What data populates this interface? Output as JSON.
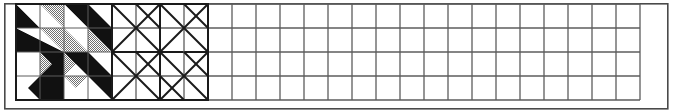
{
  "document": {
    "title": "Quilt Block Design Grid",
    "type": "pinwheel quilt block worksheet"
  },
  "canvas": {
    "width": 673,
    "height": 112,
    "background": "#ffffff"
  },
  "frame": {
    "name": "outer-frame",
    "x": 4,
    "y": 3,
    "width": 664,
    "height": 106,
    "stroke": "#4a4a4a",
    "stroke_width": 1.6,
    "fill": "#ffffff"
  },
  "grid": {
    "name": "design-grid",
    "origin_x": 16,
    "origin_y": 4,
    "cell_size": 24,
    "columns": 26,
    "rows": 4,
    "line_color": "#5c5c5c",
    "line_width": 1.3,
    "block_line_color": "#1a1a1a",
    "block_line_width": 2.0,
    "total_width": 624,
    "total_height": 96
  },
  "palette": {
    "black": "#111111",
    "gray": "#9a9a9a",
    "white": "#ffffff",
    "grid_line": "#5c5c5c",
    "frame_line": "#4a4a4a",
    "ink": "#1a1a1a"
  },
  "blocks": [
    {
      "name": "pinwheel-block-filled",
      "index": 1,
      "col_start": 0,
      "row_start": 0,
      "size_cells": 4,
      "style": "filled",
      "description": "Four-quadrant pinwheel of half-square triangles in black, gray and white"
    },
    {
      "name": "pinwheel-block-outline",
      "index": 2,
      "col_start": 4,
      "row_start": 0,
      "size_cells": 4,
      "style": "outline",
      "description": "Same pinwheel layout drawn as seam lines only, no fills"
    }
  ],
  "shapes": {
    "filled_triangles": [
      {
        "id": "tl-c00-black",
        "points": "0,0 0,24 24,24",
        "fill": "black"
      },
      {
        "id": "tl-c00-white",
        "points": "0,0 24,24 24,0",
        "fill": "white"
      },
      {
        "id": "tl-c10-white",
        "points": "24,0 24,24 48,24",
        "fill": "white"
      },
      {
        "id": "tl-c10-gray",
        "points": "24,0 48,24 48,0",
        "fill": "gray"
      },
      {
        "id": "tl-c01-black",
        "points": "0,24 0,48 48,48",
        "fill": "black"
      },
      {
        "id": "tl-c01-white",
        "points": "0,24 48,48 48,24",
        "fill": "white"
      },
      {
        "id": "tl-c11-gray",
        "points": "24,24 48,48 48,24",
        "fill": "gray"
      },
      {
        "id": "tr-c20-black",
        "points": "48,0 96,0 96,48",
        "fill": "black"
      },
      {
        "id": "tr-c20-white",
        "points": "48,0 96,48 48,48",
        "fill": "white"
      },
      {
        "id": "tr-c30-white",
        "points": "72,0 96,0 96,24",
        "fill": "white"
      },
      {
        "id": "tr-c21-gray",
        "points": "48,24 72,48 48,48",
        "fill": "gray"
      },
      {
        "id": "tr-c31-black",
        "points": "72,24 96,24 96,48",
        "fill": "black"
      },
      {
        "id": "tr-c31-gray",
        "points": "72,24 96,48 72,48",
        "fill": "gray"
      },
      {
        "id": "bl-c02-gray",
        "points": "24,48 48,48 24,72",
        "fill": "gray"
      },
      {
        "id": "bl-c02-white",
        "points": "0,48 24,48 0,72",
        "fill": "white"
      },
      {
        "id": "bl-c12-black",
        "points": "24,48 48,48 48,72",
        "fill": "black"
      },
      {
        "id": "bl-c03-black",
        "points": "0,96 48,96 48,48",
        "fill": "black"
      },
      {
        "id": "bl-c03-white",
        "points": "0,72 0,96 24,96",
        "fill": "white"
      },
      {
        "id": "br-c22-gray",
        "points": "48,48 72,48 48,72",
        "fill": "gray"
      },
      {
        "id": "br-c22-black",
        "points": "48,48 96,48 96,96",
        "fill": "black"
      },
      {
        "id": "br-c32-white",
        "points": "72,48 96,48 96,72",
        "fill": "white"
      },
      {
        "id": "br-c23-gray",
        "points": "48,72 72,72 48,96",
        "fill": "gray"
      },
      {
        "id": "br-c23-white",
        "points": "48,72 48,96 72,96",
        "fill": "white"
      }
    ],
    "outline_diagonals": [
      {
        "id": "o-tl-d1",
        "x1": 0,
        "y1": 0,
        "x2": 48,
        "y2": 48
      },
      {
        "id": "o-tl-d2",
        "x1": 48,
        "y1": 0,
        "x2": 0,
        "y2": 48
      },
      {
        "id": "o-tl-d3",
        "x1": 24,
        "y1": 0,
        "x2": 48,
        "y2": 24
      },
      {
        "id": "o-tr-d1",
        "x1": 48,
        "y1": 0,
        "x2": 96,
        "y2": 48
      },
      {
        "id": "o-tr-d2",
        "x1": 96,
        "y1": 0,
        "x2": 48,
        "y2": 48
      },
      {
        "id": "o-tr-d3",
        "x1": 72,
        "y1": 0,
        "x2": 96,
        "y2": 24
      },
      {
        "id": "o-bl-d1",
        "x1": 0,
        "y1": 48,
        "x2": 48,
        "y2": 96
      },
      {
        "id": "o-bl-d2",
        "x1": 48,
        "y1": 48,
        "x2": 0,
        "y2": 96
      },
      {
        "id": "o-bl-d3",
        "x1": 24,
        "y1": 48,
        "x2": 48,
        "y2": 72
      },
      {
        "id": "o-br-d1",
        "x1": 48,
        "y1": 48,
        "x2": 96,
        "y2": 96
      },
      {
        "id": "o-br-d2",
        "x1": 96,
        "y1": 48,
        "x2": 48,
        "y2": 96
      },
      {
        "id": "o-br-d3",
        "x1": 72,
        "y1": 48,
        "x2": 96,
        "y2": 72
      },
      {
        "id": "o-br-d4",
        "x1": 48,
        "y1": 72,
        "x2": 72,
        "y2": 96
      }
    ]
  }
}
